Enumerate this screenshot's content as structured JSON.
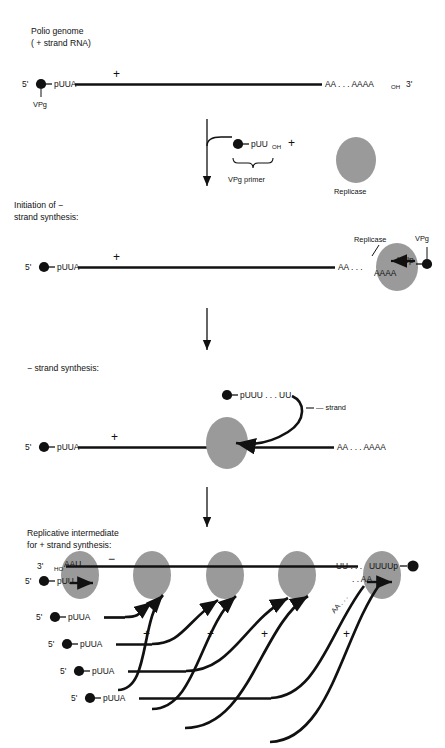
{
  "figure": {
    "title_lines": [
      "Polio genome",
      "( + strand RNA)"
    ],
    "colors": {
      "ink": "#111111",
      "replicase_fill": "#9a9a9a",
      "background": "#ffffff"
    }
  },
  "stage1": {
    "caption_line1": "Polio genome",
    "caption_line2": "( + strand RNA)",
    "five_prime": "5'",
    "three_prime": "3'",
    "left_seq": "pUUA",
    "right_seq": "AA . . . AAAA",
    "right_sub": "OH",
    "vpg_label": "VPg",
    "strand_sign": "+"
  },
  "stage1b": {
    "primer_seq": "pUU",
    "primer_sub": "OH",
    "plus_sign": "+",
    "brace_label": "VPg primer",
    "replicase_label": "Replicase"
  },
  "stage2": {
    "caption_line1": "Initiation of −",
    "caption_line2": "strand synthesis:",
    "five_prime": "5'",
    "left_seq": "pUUA",
    "strand_sign": "+",
    "right_seq": "AA . . .",
    "template_seq": "AAAA",
    "nascent_seq": "UUp",
    "replicase_label": "Replicase",
    "vpg_label": "VPg"
  },
  "stage3": {
    "caption": "− strand synthesis:",
    "five_prime": "5'",
    "left_seq": "pUUA",
    "strand_sign": "+",
    "right_seq": "AA . . . AAAA",
    "minus_strand_seq": "pUUU . . . UU",
    "minus_strand_label": "— strand"
  },
  "stage4": {
    "caption_line1": "Replicative intermediate",
    "caption_line2": "for + strand synthesis:",
    "three_prime": "3'",
    "five_prime": "5'",
    "ho_label": "HO",
    "template_left": "AAU",
    "nascent_left": "pUU",
    "minus_sign": "−",
    "template_right": "UU . . .",
    "template_right2": "UUUUp",
    "nascent_right": ". . AA",
    "diag_seq": "AA . . .",
    "nascent_strands": [
      {
        "five_prime": "5'",
        "seq": "pUUA",
        "plus": "+"
      },
      {
        "five_prime": "5'",
        "seq": "pUUA",
        "plus": "+"
      },
      {
        "five_prime": "5'",
        "seq": "pUUA",
        "plus": "+"
      },
      {
        "five_prime": "5'",
        "seq": "pUUA",
        "plus": "+"
      }
    ]
  }
}
